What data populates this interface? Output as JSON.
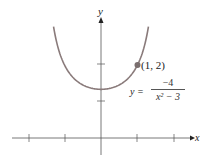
{
  "chart_data": {
    "type": "line",
    "title": "",
    "xlabel": "x",
    "ylabel": "y",
    "function": "y = -4/(x^2 - 3)",
    "equation_label": {
      "lhs": "y =",
      "numerator": "−4",
      "denominator": "x² − 3"
    },
    "annotations": [
      {
        "x": 1,
        "y": 2,
        "label": "(1, 2)"
      }
    ],
    "x_ticks": [
      -2,
      -1,
      0,
      1,
      2
    ],
    "y_ticks": [
      1,
      2
    ],
    "xlim": [
      -2.5,
      2.5
    ],
    "ylim": [
      -0.5,
      3.5
    ],
    "grid": false,
    "series": [
      {
        "name": "y = -4/(x^2-3)",
        "x": [
          -1.3,
          -1.2,
          -1.0,
          -0.8,
          -0.6,
          -0.4,
          -0.2,
          0,
          0.2,
          0.4,
          0.6,
          0.8,
          1.0,
          1.2,
          1.3
        ],
        "y": [
          3.05,
          2.56,
          2.0,
          1.7,
          1.52,
          1.41,
          1.35,
          1.33,
          1.35,
          1.41,
          1.52,
          1.7,
          2.0,
          2.56,
          3.05
        ]
      }
    ],
    "colors": {
      "curve": "#8a7b7b",
      "axis": "#444444",
      "point": "#7a6e6e"
    }
  },
  "labels": {
    "x_axis": "x",
    "y_axis": "y",
    "point": "(1, 2)",
    "eq_lhs": "y =",
    "eq_num": "−4",
    "eq_den": "x² − 3"
  }
}
